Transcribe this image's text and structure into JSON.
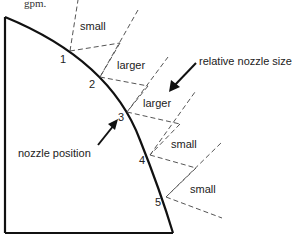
{
  "header_fragment": "gpm.",
  "diagram": {
    "nozzle_points": [
      {
        "label": "1",
        "x": 70,
        "y": 51
      },
      {
        "label": "2",
        "x": 100,
        "y": 77
      },
      {
        "label": "3",
        "x": 127,
        "y": 112
      },
      {
        "label": "4",
        "x": 150,
        "y": 155
      },
      {
        "label": "5",
        "x": 166,
        "y": 197
      }
    ],
    "segment_labels": [
      "small",
      "larger",
      "larger",
      "small",
      "small"
    ],
    "annotations": {
      "relative_size": "relative nozzle size",
      "nozzle_position": "nozzle position"
    },
    "colors": {
      "line": "#111111",
      "dashed": "#555555",
      "text": "#222222"
    }
  }
}
